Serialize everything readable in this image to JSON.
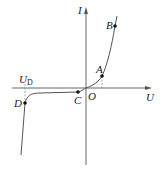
{
  "diagram": {
    "axes": {
      "x_label": "U",
      "y_label": "I",
      "origin_label": "O"
    },
    "points": [
      {
        "name": "A",
        "label": "A"
      },
      {
        "name": "B",
        "label": "B"
      },
      {
        "name": "C",
        "label": "C"
      },
      {
        "name": "D",
        "label": "D"
      }
    ],
    "breakdown_voltage": {
      "label_main": "U",
      "label_sub": "D"
    },
    "colors": {
      "axis": "#555555",
      "curve": "#555555",
      "point": "#111111",
      "dashed": "#888888"
    }
  }
}
